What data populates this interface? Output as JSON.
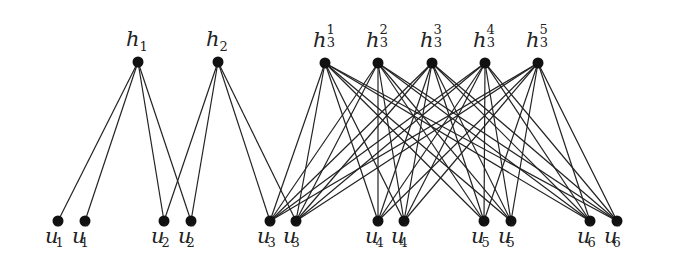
{
  "diagram": {
    "type": "bipartite-graph",
    "top_nodes": [
      {
        "id": "h1",
        "base": "h",
        "sub": "1",
        "sup": "",
        "x": 138,
        "y": 62
      },
      {
        "id": "h2",
        "base": "h",
        "sub": "2",
        "sup": "",
        "x": 218,
        "y": 62
      },
      {
        "id": "h3_1",
        "base": "h",
        "sub": "3",
        "sup": "1",
        "x": 325,
        "y": 63
      },
      {
        "id": "h3_2",
        "base": "h",
        "sub": "3",
        "sup": "2",
        "x": 378,
        "y": 63
      },
      {
        "id": "h3_3",
        "base": "h",
        "sub": "3",
        "sup": "3",
        "x": 432,
        "y": 63
      },
      {
        "id": "h3_4",
        "base": "h",
        "sub": "3",
        "sup": "4",
        "x": 485,
        "y": 63
      },
      {
        "id": "h3_5",
        "base": "h",
        "sub": "3",
        "sup": "5",
        "x": 538,
        "y": 63
      }
    ],
    "bottom_nodes": [
      {
        "id": "u1p",
        "base": "u",
        "sub": "1",
        "prime": "′",
        "x": 58,
        "y": 221
      },
      {
        "id": "u1pp",
        "base": "u",
        "sub": "1",
        "prime": "″",
        "x": 85,
        "y": 221
      },
      {
        "id": "u2p",
        "base": "u",
        "sub": "2",
        "prime": "′",
        "x": 164,
        "y": 221
      },
      {
        "id": "u2pp",
        "base": "u",
        "sub": "2",
        "prime": "″",
        "x": 191,
        "y": 221
      },
      {
        "id": "u3p",
        "base": "u",
        "sub": "3",
        "prime": "′",
        "x": 270,
        "y": 221
      },
      {
        "id": "u3pp",
        "base": "u",
        "sub": "3",
        "prime": "″",
        "x": 296,
        "y": 221
      },
      {
        "id": "u4p",
        "base": "u",
        "sub": "4",
        "prime": "′",
        "x": 378,
        "y": 221
      },
      {
        "id": "u4pp",
        "base": "u",
        "sub": "4",
        "prime": "″",
        "x": 404,
        "y": 221
      },
      {
        "id": "u5p",
        "base": "u",
        "sub": "5",
        "prime": "′",
        "x": 484,
        "y": 221
      },
      {
        "id": "u5pp",
        "base": "u",
        "sub": "5",
        "prime": "″",
        "x": 511,
        "y": 221
      },
      {
        "id": "u6p",
        "base": "u",
        "sub": "6",
        "prime": "′",
        "x": 590,
        "y": 221
      },
      {
        "id": "u6pp",
        "base": "u",
        "sub": "6",
        "prime": "″",
        "x": 617,
        "y": 221
      }
    ],
    "edges": {
      "h1": [
        "u1p",
        "u1pp",
        "u2p",
        "u2pp"
      ],
      "h2": [
        "u2p",
        "u2pp",
        "u3p",
        "u3pp"
      ],
      "h3_1": [
        "u3p",
        "u3pp",
        "u4p",
        "u4pp",
        "u5p",
        "u5pp",
        "u6p",
        "u6pp"
      ],
      "h3_2": [
        "u3p",
        "u3pp",
        "u4p",
        "u4pp",
        "u5p",
        "u5pp",
        "u6p",
        "u6pp"
      ],
      "h3_3": [
        "u3p",
        "u3pp",
        "u4p",
        "u4pp",
        "u5p",
        "u5pp",
        "u6p",
        "u6pp"
      ],
      "h3_4": [
        "u3p",
        "u3pp",
        "u4p",
        "u4pp",
        "u5p",
        "u5pp",
        "u6p",
        "u6pp"
      ],
      "h3_5": [
        "u3p",
        "u3pp",
        "u4p",
        "u4pp",
        "u5p",
        "u5pp",
        "u6p",
        "u6pp"
      ]
    },
    "colors": {
      "edge": "#222222",
      "node": "#111111",
      "background": "#ffffff"
    }
  }
}
